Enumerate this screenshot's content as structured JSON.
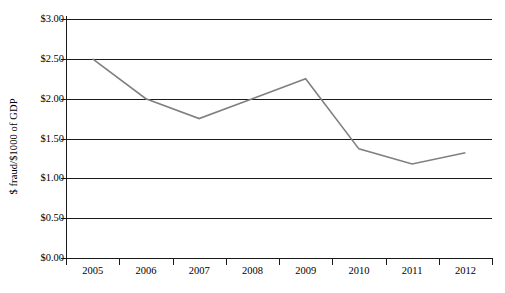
{
  "chart_data": {
    "type": "line",
    "title": "",
    "subtitle": "",
    "xlabel": "",
    "ylabel": "$ fraud/$1000 of GDP",
    "categories": [
      "2005",
      "2006",
      "2007",
      "2008",
      "2009",
      "2010",
      "2011",
      "2012"
    ],
    "series": [
      {
        "name": "$ fraud/$1000 of GDP",
        "color": "#808080",
        "values": [
          2.5,
          2.0,
          1.75,
          2.0,
          2.25,
          1.37,
          1.18,
          1.32
        ]
      }
    ],
    "ylim": [
      0.0,
      3.0
    ],
    "y_tick_values": [
      0.0,
      0.5,
      1.0,
      1.5,
      2.0,
      2.5,
      3.0
    ],
    "y_tick_labels": [
      "$0.00",
      "$0.50",
      "$1.00",
      "$1.50",
      "$2.00",
      "$2.50",
      "$3.00"
    ],
    "grid": true,
    "grid_axis": "y",
    "grid_color": "#1a1a1a",
    "legend": false,
    "legend_position": "none",
    "markers": false,
    "axis_color": "#1a1a1a",
    "background": "#ffffff"
  }
}
